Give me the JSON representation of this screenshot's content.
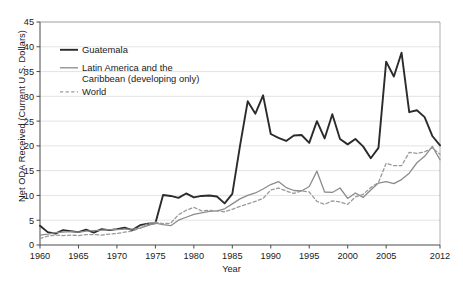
{
  "chart_data": {
    "type": "line",
    "title": "",
    "xlabel": "Year",
    "ylabel": "Net ODA Received (Current U.S. Dollars)",
    "xlim": [
      1960,
      2012
    ],
    "ylim": [
      0,
      45
    ],
    "yticks": [
      0,
      5,
      10,
      15,
      20,
      25,
      30,
      35,
      40,
      45
    ],
    "xticks": [
      1960,
      1965,
      1970,
      1975,
      1980,
      1985,
      1990,
      1995,
      2000,
      2005,
      2012
    ],
    "grid": "horizontal",
    "legend_position": "top-left",
    "x": [
      1960,
      1961,
      1962,
      1963,
      1964,
      1965,
      1966,
      1967,
      1968,
      1969,
      1970,
      1971,
      1972,
      1973,
      1974,
      1975,
      1976,
      1977,
      1978,
      1979,
      1980,
      1981,
      1982,
      1983,
      1984,
      1985,
      1986,
      1987,
      1988,
      1989,
      1990,
      1991,
      1992,
      1993,
      1994,
      1995,
      1996,
      1997,
      1998,
      1999,
      2000,
      2001,
      2002,
      2003,
      2004,
      2005,
      2006,
      2007,
      2008,
      2009,
      2010,
      2011,
      2012
    ],
    "series": [
      {
        "name": "Guatemala",
        "style": "solid",
        "color": "#2b2b2b",
        "width": 1.9,
        "values": [
          3.9,
          2.6,
          2.3,
          3.0,
          2.8,
          2.6,
          3.1,
          2.5,
          3.2,
          3.0,
          3.2,
          3.5,
          3.0,
          4.0,
          4.3,
          4.4,
          10.1,
          9.9,
          9.5,
          10.4,
          9.6,
          9.9,
          10.0,
          9.8,
          8.4,
          10.3,
          20.0,
          29.0,
          26.5,
          30.2,
          22.4,
          21.6,
          21.0,
          22.1,
          22.2,
          20.6,
          25.0,
          21.5,
          26.4,
          21.4,
          20.3,
          21.4,
          19.9,
          17.5,
          19.6,
          37.0,
          34.0,
          38.8,
          26.8,
          27.2,
          25.8,
          22.0,
          20.1
        ]
      },
      {
        "name": "Latin America and the Caribbean (developing only)",
        "style": "solid",
        "color": "#8c8c8c",
        "width": 1.3,
        "values": [
          2.0,
          2.2,
          2.5,
          2.6,
          2.7,
          2.6,
          2.8,
          2.9,
          3.0,
          3.1,
          3.1,
          3.2,
          3.2,
          3.4,
          3.9,
          4.4,
          4.1,
          3.9,
          5.0,
          5.6,
          6.2,
          6.5,
          6.8,
          6.9,
          7.3,
          8.3,
          9.3,
          10.0,
          10.5,
          11.3,
          12.2,
          12.8,
          11.6,
          11.0,
          10.9,
          11.8,
          14.9,
          10.7,
          10.6,
          11.5,
          9.4,
          10.5,
          9.6,
          11.1,
          12.5,
          12.8,
          12.4,
          13.2,
          14.5,
          16.6,
          17.9,
          19.9,
          17.2
        ]
      },
      {
        "name": "World",
        "style": "dashed",
        "color": "#9a9a9a",
        "width": 1.3,
        "values": [
          1.3,
          1.8,
          2.0,
          1.9,
          2.0,
          1.9,
          2.1,
          2.1,
          2.0,
          2.2,
          2.3,
          2.6,
          2.8,
          3.4,
          4.3,
          4.6,
          4.3,
          4.4,
          6.1,
          7.0,
          7.6,
          6.9,
          7.0,
          6.9,
          6.7,
          7.2,
          7.8,
          8.3,
          8.8,
          9.4,
          11.1,
          11.5,
          10.9,
          10.4,
          10.9,
          10.7,
          8.8,
          8.2,
          8.9,
          8.7,
          8.2,
          9.7,
          10.2,
          11.6,
          12.6,
          16.5,
          16.0,
          16.0,
          18.7,
          18.5,
          18.8,
          19.6,
          18.3
        ]
      }
    ]
  },
  "legend": {
    "items": [
      {
        "label": "Guatemala"
      },
      {
        "label": "Latin America and the"
      },
      {
        "label": "Caribbean (developing only)"
      },
      {
        "label": "World"
      }
    ]
  }
}
